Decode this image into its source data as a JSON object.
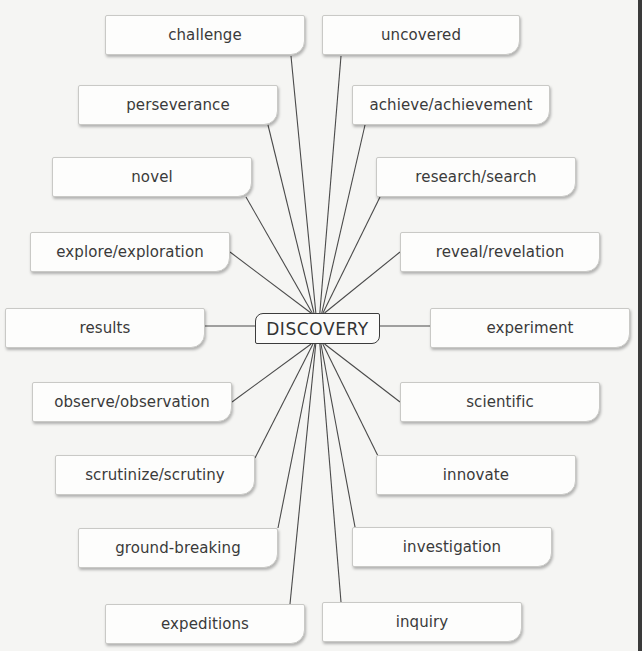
{
  "center": {
    "label": "DISCOVERY",
    "x": 255,
    "y": 313,
    "w": 125,
    "h": 31
  },
  "line_color": "#4a4a4a",
  "hub": {
    "x": 318,
    "y": 328
  },
  "nodes": [
    {
      "id": "challenge",
      "label": "challenge",
      "x": 105,
      "y": 15,
      "w": 200,
      "h": 40,
      "anchor": [
        291,
        56
      ]
    },
    {
      "id": "uncovered",
      "label": "uncovered",
      "x": 322,
      "y": 15,
      "w": 198,
      "h": 40,
      "anchor": [
        341,
        56
      ]
    },
    {
      "id": "perseverance",
      "label": "perseverance",
      "x": 78,
      "y": 85,
      "w": 200,
      "h": 40,
      "anchor": [
        268,
        125
      ]
    },
    {
      "id": "achieve-achievement",
      "label": "achieve/achievement",
      "x": 352,
      "y": 85,
      "w": 198,
      "h": 40,
      "anchor": [
        365,
        125
      ]
    },
    {
      "id": "novel",
      "label": "novel",
      "x": 52,
      "y": 157,
      "w": 200,
      "h": 40,
      "anchor": [
        246,
        197
      ]
    },
    {
      "id": "research-search",
      "label": "research/search",
      "x": 376,
      "y": 157,
      "w": 200,
      "h": 40,
      "anchor": [
        380,
        197
      ]
    },
    {
      "id": "explore-exploration",
      "label": "explore/exploration",
      "x": 30,
      "y": 232,
      "w": 200,
      "h": 40,
      "anchor": [
        230,
        252
      ]
    },
    {
      "id": "reveal-revelation",
      "label": "reveal/revelation",
      "x": 400,
      "y": 232,
      "w": 200,
      "h": 40,
      "anchor": [
        400,
        252
      ]
    },
    {
      "id": "results",
      "label": "results",
      "x": 5,
      "y": 308,
      "w": 200,
      "h": 40,
      "anchor": [
        205,
        326
      ]
    },
    {
      "id": "experiment",
      "label": "experiment",
      "x": 430,
      "y": 308,
      "w": 200,
      "h": 40,
      "anchor": [
        430,
        326
      ]
    },
    {
      "id": "observe-observation",
      "label": "observe/observation",
      "x": 32,
      "y": 382,
      "w": 200,
      "h": 40,
      "anchor": [
        232,
        402
      ]
    },
    {
      "id": "scientific",
      "label": "scientific",
      "x": 400,
      "y": 382,
      "w": 200,
      "h": 40,
      "anchor": [
        400,
        402
      ]
    },
    {
      "id": "scrutinize-scrutiny",
      "label": "scrutinize/scrutiny",
      "x": 55,
      "y": 455,
      "w": 200,
      "h": 40,
      "anchor": [
        255,
        458
      ]
    },
    {
      "id": "innovate",
      "label": "innovate",
      "x": 376,
      "y": 455,
      "w": 200,
      "h": 40,
      "anchor": [
        378,
        456
      ]
    },
    {
      "id": "ground-breaking",
      "label": "ground-breaking",
      "x": 78,
      "y": 528,
      "w": 200,
      "h": 40,
      "anchor": [
        278,
        528
      ]
    },
    {
      "id": "investigation",
      "label": "investigation",
      "x": 352,
      "y": 527,
      "w": 200,
      "h": 40,
      "anchor": [
        355,
        527
      ]
    },
    {
      "id": "expeditions",
      "label": "expeditions",
      "x": 105,
      "y": 604,
      "w": 200,
      "h": 40,
      "anchor": [
        290,
        604
      ]
    },
    {
      "id": "inquiry",
      "label": "inquiry",
      "x": 322,
      "y": 602,
      "w": 200,
      "h": 40,
      "anchor": [
        341,
        602
      ]
    }
  ]
}
